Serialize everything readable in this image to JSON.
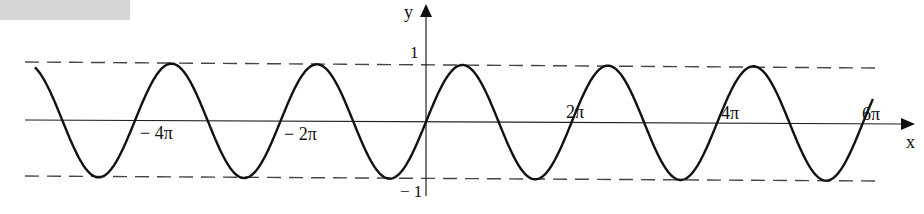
{
  "chart_data": {
    "type": "line",
    "title": "",
    "function_description": "y = sin(x), periodic wave with period 2π oscillating between -1 and 1",
    "xlabel": "x",
    "ylabel": "y",
    "x_tick_labels": [
      "− 4π",
      "− 2π",
      "2π",
      "4π",
      "6π"
    ],
    "x_tick_values": [
      -12.566,
      -6.283,
      6.283,
      12.566,
      18.85
    ],
    "y_tick_labels": [
      "1",
      "− 1"
    ],
    "y_tick_values": [
      1,
      -1
    ],
    "xlim": [
      -16.2,
      19.3
    ],
    "ylim": [
      -1,
      1
    ],
    "guide_lines": [
      {
        "y": 1,
        "style": "dashed"
      },
      {
        "y": -1,
        "style": "dashed"
      }
    ],
    "series": [
      {
        "name": "sin(x)",
        "period": 6.283,
        "amplitude": 1,
        "color": "#111111"
      }
    ],
    "grid": false,
    "legend": null
  },
  "axes": {
    "x_label": "x",
    "y_label": "y",
    "y_max_label": "1",
    "y_min_label": "− 1",
    "ticks": {
      "neg4pi": "− 4π",
      "neg2pi": "− 2π",
      "pos2pi": "2π",
      "pos4pi": "4π",
      "pos6pi": "6π"
    }
  },
  "colors": {
    "curve": "#111111",
    "axis": "#222222",
    "dashed": "#444444",
    "header_bar": "#d6d6d6"
  }
}
